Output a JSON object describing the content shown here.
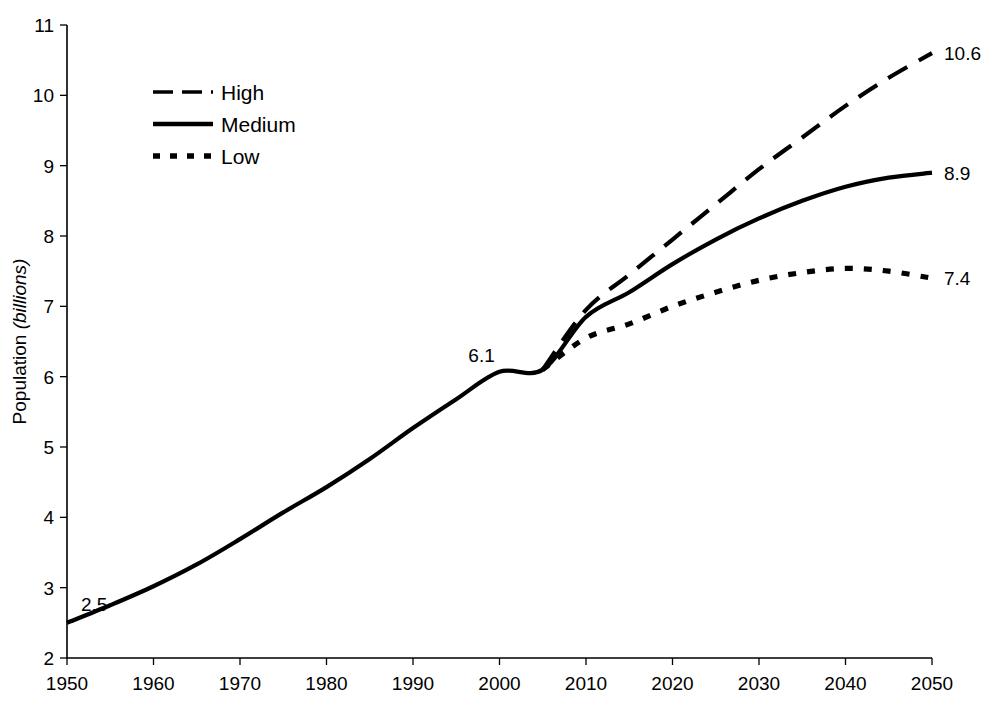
{
  "chart_data": {
    "type": "line",
    "title": "",
    "xlabel": "",
    "ylabel": "Population (billions)",
    "ylabel_main": "Population",
    "ylabel_italic": "(billions)",
    "xlim": [
      1950,
      2050
    ],
    "ylim": [
      2,
      11
    ],
    "grid": false,
    "legend_position": "top-left",
    "x_ticks": [
      "1950",
      "1960",
      "1970",
      "1980",
      "1990",
      "2000",
      "2010",
      "2020",
      "2030",
      "2040",
      "2050"
    ],
    "x_tick_values": [
      1950,
      1960,
      1970,
      1980,
      1990,
      2000,
      2010,
      2020,
      2030,
      2040,
      2050
    ],
    "y_ticks": [
      "2",
      "3",
      "4",
      "5",
      "6",
      "7",
      "8",
      "9",
      "10",
      "11"
    ],
    "y_tick_values": [
      2,
      3,
      4,
      5,
      6,
      7,
      8,
      9,
      10,
      11
    ],
    "x": [
      1950,
      1955,
      1960,
      1965,
      1970,
      1975,
      1980,
      1985,
      1990,
      1995,
      2000,
      2005,
      2010,
      2015,
      2020,
      2025,
      2030,
      2035,
      2040,
      2045,
      2050
    ],
    "series": [
      {
        "name": "High",
        "style": "dashed",
        "color": "#000000",
        "end_label": "10.6",
        "values": [
          null,
          null,
          null,
          null,
          null,
          null,
          null,
          null,
          null,
          null,
          null,
          6.1,
          6.95,
          7.45,
          7.95,
          8.45,
          8.95,
          9.4,
          9.85,
          10.25,
          10.6
        ]
      },
      {
        "name": "Medium",
        "style": "solid",
        "color": "#000000",
        "end_label": "8.9",
        "values": [
          2.5,
          2.75,
          3.02,
          3.33,
          3.69,
          4.07,
          4.43,
          4.83,
          5.27,
          5.68,
          6.07,
          6.1,
          6.85,
          7.2,
          7.6,
          7.95,
          8.25,
          8.5,
          8.7,
          8.83,
          8.9
        ]
      },
      {
        "name": "Low",
        "style": "dotted",
        "color": "#000000",
        "end_label": "7.4",
        "values": [
          null,
          null,
          null,
          null,
          null,
          null,
          null,
          null,
          null,
          null,
          null,
          6.1,
          6.55,
          6.75,
          7.0,
          7.2,
          7.37,
          7.48,
          7.54,
          7.5,
          7.4
        ]
      }
    ],
    "annotations": [
      {
        "label": "2.5",
        "x": 1950,
        "y": 2.5,
        "note": "start value of medium series"
      },
      {
        "label": "6.1",
        "x": 2005,
        "y": 6.1,
        "note": "branch point where projections diverge"
      },
      {
        "label": "10.6",
        "x": 2050,
        "y": 10.6,
        "note": "high variant end value"
      },
      {
        "label": "8.9",
        "x": 2050,
        "y": 8.9,
        "note": "medium variant end value"
      },
      {
        "label": "7.4",
        "x": 2050,
        "y": 7.4,
        "note": "low variant end value"
      }
    ]
  },
  "legend": {
    "items": [
      {
        "label": "High"
      },
      {
        "label": "Medium"
      },
      {
        "label": "Low"
      }
    ]
  }
}
